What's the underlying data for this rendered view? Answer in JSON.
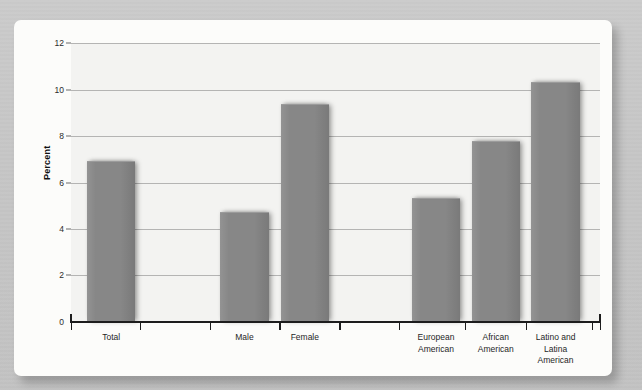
{
  "figure": {
    "background_color": "#c9c9c9",
    "card_color": "#fcfcfa",
    "plot_background_color": "#f3f3f1",
    "bar_color": "#878787",
    "gridline_color": "#a8a8a8",
    "axis_color": "#1d1d1d"
  },
  "chart_data": {
    "type": "bar",
    "title": "",
    "subtitle": "",
    "xlabel": "",
    "ylabel": "Percent",
    "ylim": [
      0,
      12
    ],
    "y_ticks": [
      0,
      2,
      4,
      6,
      8,
      10,
      12
    ],
    "y_tick_labels": [
      "0",
      "2",
      "4",
      "6",
      "8",
      "10",
      "12"
    ],
    "grid": true,
    "legend": false,
    "legend_position": "none",
    "categories": [
      "Total",
      "Male",
      "Female",
      "European\nAmerican",
      "African\nAmerican",
      "Latino and\nLatina American"
    ],
    "category_labels": [
      "Total",
      "Male",
      "Female",
      "European American",
      "African American",
      "Latino and Latina American"
    ],
    "values": [
      6.9,
      4.7,
      9.35,
      5.3,
      7.75,
      10.3
    ],
    "groups": [
      {
        "name": "overall",
        "categories": [
          "Total"
        ]
      },
      {
        "name": "sex",
        "categories": [
          "Male",
          "Female"
        ]
      },
      {
        "name": "race-ethnicity",
        "categories": [
          "European American",
          "African American",
          "Latino and Latina American"
        ]
      }
    ]
  },
  "bars": [
    {
      "label": "Total",
      "label_line1": "Total",
      "label_line2": "",
      "value": 6.9,
      "center_pct": 7.6,
      "width_pct": 9.1
    },
    {
      "label": "Male",
      "label_line1": "Male",
      "label_line2": "",
      "value": 4.7,
      "center_pct": 32.8,
      "width_pct": 9.1
    },
    {
      "label": "Female",
      "label_line1": "Female",
      "label_line2": "",
      "value": 9.35,
      "center_pct": 44.2,
      "width_pct": 9.1
    },
    {
      "label": "European American",
      "label_line1": "European",
      "label_line2": "American",
      "value": 5.3,
      "center_pct": 69.0,
      "width_pct": 9.1
    },
    {
      "label": "African American",
      "label_line1": "African",
      "label_line2": "American",
      "value": 7.75,
      "center_pct": 80.3,
      "width_pct": 9.1
    },
    {
      "label": "Latino and Latina American",
      "label_line1": "Latino and",
      "label_line2": "Latina American",
      "value": 10.3,
      "center_pct": 91.6,
      "width_pct": 9.1
    }
  ],
  "x_tick_positions_pct": [
    0,
    13.0,
    26.2,
    39.4,
    50.7,
    62.0,
    74.5,
    86.0,
    98.5,
    100
  ]
}
